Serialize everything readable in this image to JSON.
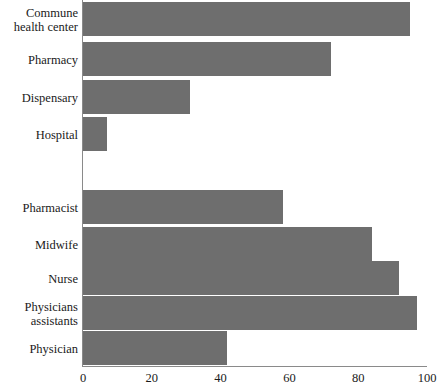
{
  "chart_data": {
    "type": "bar",
    "orientation": "horizontal",
    "title": "",
    "xlabel": "",
    "ylabel": "",
    "xlim": [
      0,
      100
    ],
    "xticks": [
      0,
      20,
      40,
      60,
      80,
      100
    ],
    "xtick_labels": [
      "0",
      "20",
      "40",
      "60",
      "80",
      "100"
    ],
    "grid": false,
    "legend": false,
    "bar_color": "#6e6e6e",
    "axis_color": "#8a8a8a",
    "groups": [
      {
        "name": "facilities",
        "categories": [
          "Commune\nhealth center",
          "Pharmacy",
          "Dispensary",
          "Hospital"
        ],
        "values": [
          95,
          72,
          31,
          7
        ]
      },
      {
        "name": "providers",
        "categories": [
          "Pharmacist",
          "Midwife",
          "Nurse",
          "Physicians\nassistants",
          "Physician"
        ],
        "values": [
          58,
          84,
          92,
          97,
          42
        ]
      }
    ],
    "categories": [
      "Commune\nhealth center",
      "Pharmacy",
      "Dispensary",
      "Hospital",
      "Pharmacist",
      "Midwife",
      "Nurse",
      "Physicians\nassistants",
      "Physician"
    ],
    "values": [
      95,
      72,
      31,
      7,
      58,
      84,
      92,
      97,
      42
    ]
  },
  "layout": {
    "rows": [
      {
        "key": "commune-health-center",
        "top": 2,
        "label_top": 6,
        "value_index": 0
      },
      {
        "key": "pharmacy",
        "top": 42,
        "label_top": 53,
        "value_index": 1
      },
      {
        "key": "dispensary",
        "top": 80,
        "label_top": 91,
        "value_index": 2
      },
      {
        "key": "hospital",
        "top": 117,
        "label_top": 128,
        "value_index": 3
      },
      {
        "key": "pharmacist",
        "top": 190,
        "label_top": 201,
        "value_index": 4
      },
      {
        "key": "midwife",
        "top": 227,
        "label_top": 238,
        "value_index": 5
      },
      {
        "key": "nurse",
        "top": 261,
        "label_top": 272,
        "value_index": 6
      },
      {
        "key": "physicians-assistants",
        "top": 296,
        "label_top": 300,
        "value_index": 7
      },
      {
        "key": "physician",
        "top": 331,
        "label_top": 342,
        "value_index": 8
      }
    ]
  }
}
